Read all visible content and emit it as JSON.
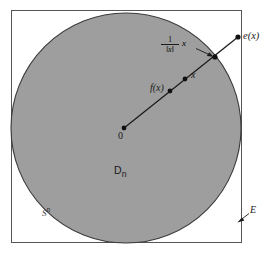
{
  "figure": {
    "type": "mathematical-diagram",
    "background_color": "#ffffff",
    "ink_color": "#1a1a1a",
    "disk_fill_color": "#9e9e9e"
  },
  "frame": {
    "label": "E",
    "description": "outer square boundary representing the space E",
    "x": 11,
    "y": 10,
    "width": 231,
    "height": 233,
    "stroke_color": "#555555"
  },
  "disk": {
    "label": "D",
    "label_subscript": "n",
    "label_full": "Dn",
    "description": "shaded unit disk",
    "center_x": 126,
    "center_y": 128,
    "radius": 115,
    "fill_color": "#9e9e9e",
    "stroke_color": "#3a3a3a"
  },
  "sphere": {
    "label": "S",
    "label_superscript": "n",
    "label_full": "Sn",
    "description": "boundary circle of the disk"
  },
  "ray": {
    "description": "ray from the origin through x out to e(x) on the frame",
    "start_x": 124,
    "start_y": 128,
    "end_x": 238,
    "end_y": 37,
    "stroke_color": "#1a1a1a"
  },
  "points": [
    {
      "name": "origin",
      "label": "0",
      "x": 124,
      "y": 128
    },
    {
      "name": "f-of-x",
      "label": "f(x)",
      "x": 170,
      "y": 91
    },
    {
      "name": "x",
      "label": "x",
      "x": 185,
      "y": 79
    },
    {
      "name": "boundary",
      "label": "",
      "x": 215,
      "y": 57
    },
    {
      "name": "e-of-x",
      "label": "e(x)",
      "x": 238,
      "y": 37
    }
  ],
  "normalized_vector": {
    "numerator": "1",
    "denominator": "‖x‖",
    "multiplicand": "x",
    "full": "1/‖x‖ x",
    "description": "label for the unit vector in the direction of x, pointing at the boundary intersection"
  },
  "arrows": [
    {
      "name": "normalized-vector-pointer",
      "from_x": 196,
      "from_y": 48,
      "to_x": 213,
      "to_y": 56,
      "points_to": "boundary intersection point"
    },
    {
      "name": "space-E-pointer",
      "from_x": 249,
      "from_y": 214,
      "to_x": 238,
      "to_y": 222,
      "points_to": "outer square frame"
    }
  ]
}
